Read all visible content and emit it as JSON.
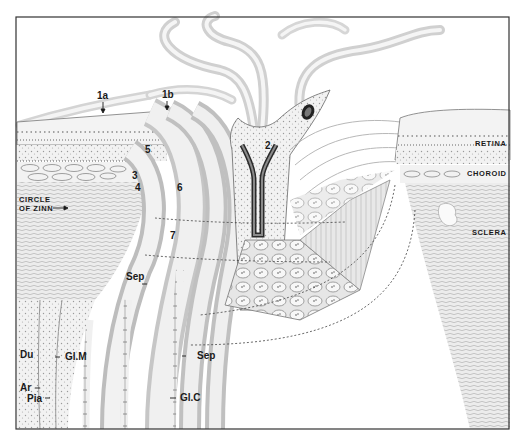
{
  "figure": {
    "frame_color": "#333333",
    "ink_color": "#1a1a1a",
    "paper_color": "#ffffff",
    "labels": {
      "l1a": "1a",
      "l1b": "1b",
      "l2": "2",
      "l3": "3",
      "l4": "4",
      "l5": "5",
      "l6": "6",
      "l7": "7",
      "circle_of_zinn_1": "CIRCLE",
      "circle_of_zinn_2": "OF ZINN",
      "retina": "RETINA",
      "choroid": "CHOROID",
      "sclera": "SCLERA",
      "sep_upper": "Sep",
      "sep_lower": "Sep",
      "du": "Du",
      "glm": "Gl.M",
      "ar": "Ar",
      "pia": "Pia",
      "glc": "Gl.C"
    }
  }
}
